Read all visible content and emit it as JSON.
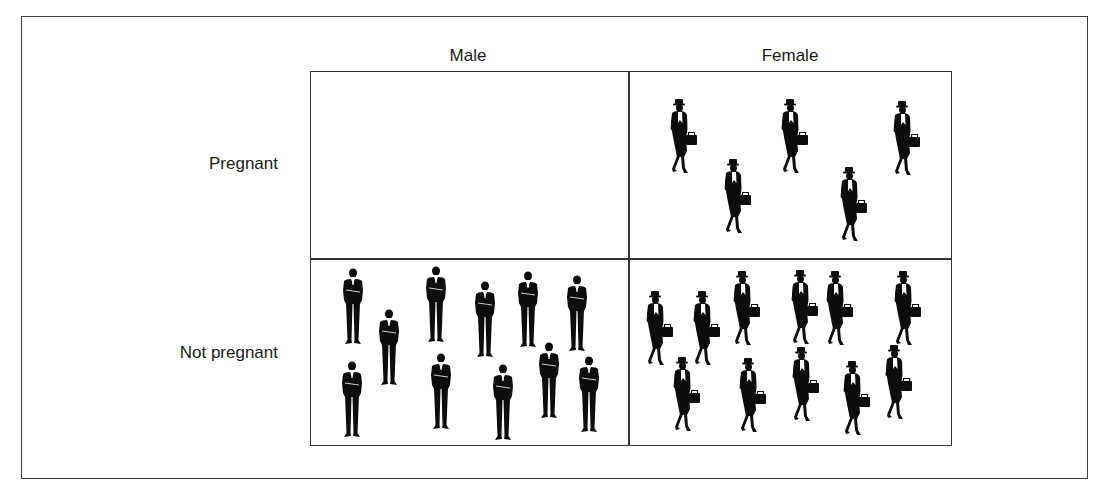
{
  "columns": [
    "Male",
    "Female"
  ],
  "rows": [
    "Pregnant",
    "Not pregnant"
  ],
  "colors": {
    "line": "#333333",
    "figure": "#0d0d0d",
    "background": "#ffffff"
  },
  "cells": {
    "male_pregnant": {
      "count": 0,
      "figure": "man-in-suit-icon",
      "positions": []
    },
    "female_pregnant": {
      "count": 5,
      "figure": "woman-with-briefcase-icon",
      "positions": [
        [
          679,
          99
        ],
        [
          733,
          159
        ],
        [
          790,
          99
        ],
        [
          849,
          167
        ],
        [
          902,
          101
        ]
      ]
    },
    "male_not_pregnant": {
      "count": 11,
      "figure": "man-in-suit-icon",
      "positions": [
        [
          353,
          268
        ],
        [
          389,
          309
        ],
        [
          436,
          266
        ],
        [
          485,
          281
        ],
        [
          528,
          271
        ],
        [
          577,
          275
        ],
        [
          352,
          361
        ],
        [
          441,
          353
        ],
        [
          503,
          364
        ],
        [
          549,
          342
        ],
        [
          589,
          356
        ]
      ]
    },
    "female_not_pregnant": {
      "count": 11,
      "figure": "woman-with-briefcase-icon",
      "positions": [
        [
          655,
          291
        ],
        [
          702,
          291
        ],
        [
          742,
          271
        ],
        [
          800,
          270
        ],
        [
          835,
          271
        ],
        [
          903,
          271
        ],
        [
          682,
          357
        ],
        [
          748,
          358
        ],
        [
          801,
          347
        ],
        [
          852,
          361
        ],
        [
          894,
          345
        ]
      ]
    }
  }
}
